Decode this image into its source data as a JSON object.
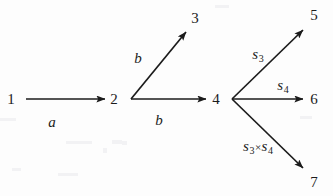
{
  "figure": {
    "background_color": "#fdfdfd",
    "ink_color": "#1b1b1b",
    "width": 333,
    "height": 196
  },
  "nodes": [
    {
      "id": "1",
      "label": "1",
      "x": 11,
      "y": 99
    },
    {
      "id": "2",
      "label": "2",
      "x": 114,
      "y": 99
    },
    {
      "id": "3",
      "label": "3",
      "x": 195,
      "y": 18
    },
    {
      "id": "4",
      "label": "4",
      "x": 216,
      "y": 99
    },
    {
      "id": "5",
      "label": "5",
      "x": 314,
      "y": 15
    },
    {
      "id": "6",
      "label": "6",
      "x": 314,
      "y": 99
    },
    {
      "id": "7",
      "label": "7",
      "x": 314,
      "y": 182
    }
  ],
  "edges": [
    {
      "id": "e1",
      "from": "1",
      "to": "2",
      "label": "a",
      "label_html": "a",
      "label_x": 52,
      "label_y": 122,
      "x1": 26,
      "y1": 99,
      "x2": 105,
      "y2": 99
    },
    {
      "id": "e2",
      "from": "2",
      "to": "3",
      "label": "b",
      "label_html": "b",
      "label_x": 138,
      "label_y": 58,
      "x1": 131,
      "y1": 99,
      "x2": 186,
      "y2": 32
    },
    {
      "id": "e3",
      "from": "2",
      "to": "4",
      "label": "b",
      "label_html": "b",
      "label_x": 159,
      "label_y": 120,
      "x1": 131,
      "y1": 99,
      "x2": 206,
      "y2": 99
    },
    {
      "id": "e4",
      "from": "4",
      "to": "5",
      "label": "s3",
      "label_html": "s<sub>3</sub>",
      "label_x": 258,
      "label_y": 54,
      "x1": 232,
      "y1": 99,
      "x2": 303,
      "y2": 30
    },
    {
      "id": "e5",
      "from": "4",
      "to": "6",
      "label": "s4",
      "label_html": "s<sub>4</sub>",
      "label_x": 283,
      "label_y": 85,
      "x1": 232,
      "y1": 99,
      "x2": 303,
      "y2": 99
    },
    {
      "id": "e6",
      "from": "4",
      "to": "7",
      "label": "s3×s4",
      "label_html": "s<sub>3</sub><span class=\"times\">×</span>s<sub>4</sub>",
      "label_x": 258,
      "label_y": 146,
      "x1": 232,
      "y1": 99,
      "x2": 303,
      "y2": 168
    }
  ]
}
